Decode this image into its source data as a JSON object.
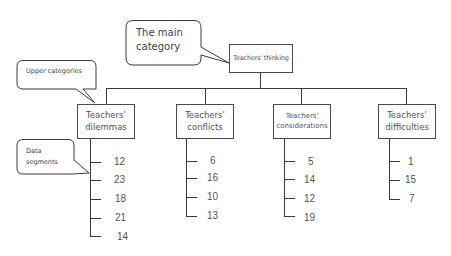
{
  "diagram": {
    "root": {
      "label": "Teachers' thinking"
    },
    "categories": [
      {
        "label_line1": "Teachers'",
        "label_line2": "dilemmas",
        "segments": [
          "12",
          "23",
          "18",
          "21",
          "14"
        ]
      },
      {
        "label_line1": "Teachers'",
        "label_line2": "conflicts",
        "segments": [
          "6",
          "16",
          "10",
          "13"
        ]
      },
      {
        "label_line1": "Teachers'",
        "label_line2": "considerations",
        "segments": [
          "5",
          "14",
          "12",
          "19"
        ]
      },
      {
        "label_line1": "Teachers'",
        "label_line2": "difficulties",
        "segments": [
          "1",
          "15",
          "7"
        ]
      }
    ],
    "callouts": {
      "main": {
        "line1": "The main",
        "line2": "category"
      },
      "upper": {
        "text": "Upper categories"
      },
      "data": {
        "line1": "Data",
        "line2": "segments"
      }
    }
  }
}
